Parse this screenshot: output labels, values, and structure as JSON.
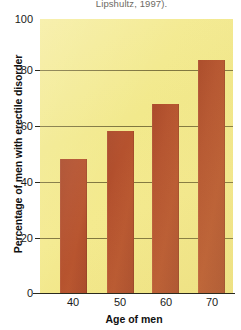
{
  "figure": {
    "caption": "Lipshultz, 1997).",
    "colors": {
      "bar": "#B4512E",
      "plot_background": "#F2E98C",
      "gridline": "#6B6231",
      "axis": "#2A2A1E",
      "text": "#1A1A1A"
    }
  },
  "chart_data": {
    "type": "bar",
    "title": "",
    "subtitle": "",
    "caption": "Lipshultz, 1997).",
    "categories": [
      "40",
      "50",
      "60",
      "70"
    ],
    "values": [
      49,
      59,
      69,
      85
    ],
    "series": [
      {
        "name": "Percentage of men with erectile disorder",
        "values": [
          49,
          59,
          69,
          85
        ]
      }
    ],
    "xlabel": "Age of men",
    "ylabel": "Percentage of men with erectile disorder",
    "ylim": [
      0,
      100
    ],
    "yticks": [
      0,
      20,
      40,
      60,
      80,
      100
    ],
    "ytick_labels": [
      "0",
      "20",
      "40",
      "60",
      "80",
      "100"
    ],
    "xtick_labels": [
      "40",
      "50",
      "60",
      "70"
    ],
    "grid": true,
    "grid_axis": "y",
    "legend": false,
    "legend_position": "none",
    "bar_color": "#B4512E",
    "plot_background": "#F2E98C"
  }
}
